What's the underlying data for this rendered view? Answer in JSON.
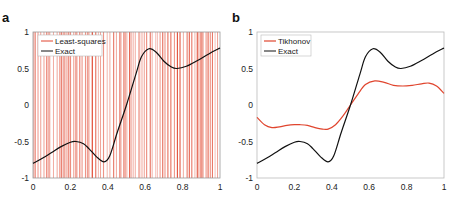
{
  "chart_data": [
    {
      "panel": "a",
      "type": "line",
      "title": "",
      "xlabel": "",
      "ylabel": "",
      "xlim": [
        0,
        1
      ],
      "ylim": [
        -1,
        1
      ],
      "xticks": [
        "0",
        "0.2",
        "0.4",
        "0.6",
        "0.8",
        "1"
      ],
      "yticks": [
        "-1",
        "-0.5",
        "0",
        "0.5",
        "1"
      ],
      "grid": false,
      "legend_position": "upper left",
      "series": [
        {
          "name": "Least-squares",
          "color": "#e0452e",
          "note": "wildly oscillating solution, appears as dense vertical red lines spanning the full y-range"
        },
        {
          "name": "Exact",
          "color": "#111111",
          "x": [
            0,
            0.05,
            0.1,
            0.15,
            0.2,
            0.23,
            0.27,
            0.3,
            0.34,
            0.38,
            0.41,
            0.45,
            0.5,
            0.55,
            0.58,
            0.62,
            0.66,
            0.7,
            0.74,
            0.77,
            0.82,
            0.88,
            0.94,
            1.0
          ],
          "y": [
            -0.8,
            -0.73,
            -0.65,
            -0.57,
            -0.51,
            -0.5,
            -0.53,
            -0.6,
            -0.71,
            -0.78,
            -0.7,
            -0.38,
            0.0,
            0.42,
            0.66,
            0.77,
            0.72,
            0.6,
            0.52,
            0.5,
            0.53,
            0.61,
            0.7,
            0.78
          ]
        }
      ]
    },
    {
      "panel": "b",
      "type": "line",
      "title": "",
      "xlabel": "",
      "ylabel": "",
      "xlim": [
        0,
        1
      ],
      "ylim": [
        -1,
        1
      ],
      "xticks": [
        "0",
        "0.2",
        "0.4",
        "0.6",
        "0.8",
        "1"
      ],
      "yticks": [
        "-1",
        "-0.5",
        "0",
        "0.5",
        "1"
      ],
      "grid": false,
      "legend_position": "upper left",
      "series": [
        {
          "name": "Tikhonov",
          "color": "#e0452e",
          "x": [
            0,
            0.04,
            0.08,
            0.12,
            0.16,
            0.2,
            0.23,
            0.27,
            0.31,
            0.35,
            0.38,
            0.42,
            0.46,
            0.5,
            0.54,
            0.58,
            0.63,
            0.68,
            0.73,
            0.78,
            0.83,
            0.88,
            0.92,
            0.96,
            1.0
          ],
          "y": [
            -0.17,
            -0.27,
            -0.31,
            -0.3,
            -0.28,
            -0.27,
            -0.27,
            -0.28,
            -0.31,
            -0.33,
            -0.33,
            -0.27,
            -0.15,
            0.0,
            0.15,
            0.28,
            0.33,
            0.31,
            0.27,
            0.26,
            0.27,
            0.29,
            0.3,
            0.26,
            0.16
          ]
        },
        {
          "name": "Exact",
          "color": "#111111",
          "x": [
            0,
            0.05,
            0.1,
            0.15,
            0.2,
            0.23,
            0.27,
            0.3,
            0.34,
            0.38,
            0.41,
            0.45,
            0.5,
            0.55,
            0.58,
            0.62,
            0.66,
            0.7,
            0.74,
            0.77,
            0.82,
            0.88,
            0.94,
            1.0
          ],
          "y": [
            -0.8,
            -0.73,
            -0.65,
            -0.57,
            -0.51,
            -0.5,
            -0.53,
            -0.6,
            -0.71,
            -0.78,
            -0.7,
            -0.38,
            0.0,
            0.42,
            0.66,
            0.77,
            0.72,
            0.6,
            0.52,
            0.5,
            0.53,
            0.61,
            0.7,
            0.78
          ]
        }
      ]
    }
  ],
  "panels": {
    "a": {
      "label": "a",
      "legend": [
        "Least-squares",
        "Exact"
      ],
      "xticks": [
        "0",
        "0.2",
        "0.4",
        "0.6",
        "0.8",
        "1"
      ],
      "yticks": [
        "1",
        "0.5",
        "0",
        "-0.5",
        "-1"
      ]
    },
    "b": {
      "label": "b",
      "legend": [
        "Tikhonov",
        "Exact"
      ],
      "xticks": [
        "0",
        "0.2",
        "0.4",
        "0.6",
        "0.8",
        "1"
      ],
      "yticks": [
        "1",
        "0.5",
        "0",
        "-0.5",
        "-1"
      ]
    }
  },
  "colors": {
    "red": "#e0452e",
    "black": "#111111",
    "axis": "#999999"
  }
}
